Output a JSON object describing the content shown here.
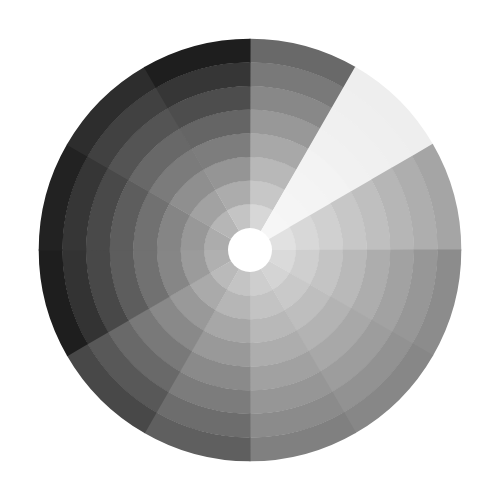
{
  "wheel": {
    "center": [
      250,
      250
    ],
    "outer_radius": 211,
    "hole_radius": 22,
    "ring_count": 8,
    "sector_count": 12,
    "start_angle_deg": 0,
    "hole_color": "#ffffff",
    "background": "#ffffff",
    "sectors": [
      {
        "inner_gray": 215,
        "outer_gray": 105
      },
      {
        "inner_gray": 246,
        "outer_gray": 238
      },
      {
        "inner_gray": 225,
        "outer_gray": 165
      },
      {
        "inner_gray": 218,
        "outer_gray": 140
      },
      {
        "inner_gray": 212,
        "outer_gray": 135
      },
      {
        "inner_gray": 206,
        "outer_gray": 128
      },
      {
        "inner_gray": 196,
        "outer_gray": 95
      },
      {
        "inner_gray": 186,
        "outer_gray": 72
      },
      {
        "inner_gray": 176,
        "outer_gray": 30
      },
      {
        "inner_gray": 172,
        "outer_gray": 34
      },
      {
        "inner_gray": 182,
        "outer_gray": 45
      },
      {
        "inner_gray": 196,
        "outer_gray": 30
      }
    ]
  }
}
